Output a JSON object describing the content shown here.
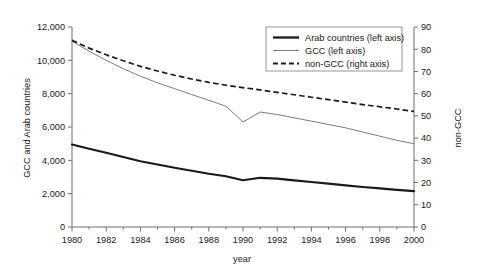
{
  "chart_data": {
    "type": "line",
    "title": "",
    "xlabel": "year",
    "ylabel": "GCC and Arab countries",
    "y2label": "non-GCC",
    "xlim": [
      1980,
      2000
    ],
    "ylim": [
      0,
      12000
    ],
    "y2lim": [
      0,
      90
    ],
    "grid": false,
    "legend_position": "top-right",
    "x": [
      1980,
      1981,
      1982,
      1983,
      1984,
      1985,
      1986,
      1987,
      1988,
      1989,
      1990,
      1991,
      1992,
      1993,
      1994,
      1995,
      1996,
      1997,
      1998,
      1999,
      2000
    ],
    "xticks": [
      1980,
      1982,
      1984,
      1986,
      1988,
      1990,
      1992,
      1994,
      1996,
      1998,
      2000
    ],
    "xtick_labels": [
      "1980",
      "1982",
      "1984",
      "1986",
      "1988",
      "1990",
      "1992",
      "1994",
      "1996",
      "1998",
      "2000"
    ],
    "yticks": [
      0,
      2000,
      4000,
      6000,
      8000,
      10000,
      12000
    ],
    "ytick_labels": [
      "0",
      "2,000",
      "4,000",
      "6,000",
      "8,000",
      "10,000",
      "12,000"
    ],
    "y2ticks": [
      0,
      10,
      20,
      30,
      40,
      50,
      60,
      70,
      80,
      90
    ],
    "y2tick_labels": [
      "0",
      "10",
      "20",
      "30",
      "40",
      "50",
      "60",
      "70",
      "80",
      "90"
    ],
    "series": [
      {
        "name": "Arab countries (left axis)",
        "axis": "left",
        "style": "solid-thick",
        "color": "#1a1a1a",
        "values": [
          4950,
          4700,
          4450,
          4200,
          3950,
          3750,
          3550,
          3380,
          3200,
          3050,
          2800,
          2950,
          2900,
          2800,
          2700,
          2600,
          2500,
          2400,
          2320,
          2230,
          2150
        ]
      },
      {
        "name": "GCC (left axis)",
        "axis": "left",
        "style": "solid-thin",
        "color": "#7d7d7d",
        "values": [
          11150,
          10550,
          10000,
          9500,
          9050,
          8650,
          8300,
          7950,
          7600,
          7250,
          6300,
          6900,
          6750,
          6550,
          6350,
          6150,
          5950,
          5700,
          5450,
          5200,
          5000
        ]
      },
      {
        "name": "non-GCC (right axis)",
        "axis": "right",
        "style": "dashed",
        "color": "#1a1a1a",
        "values": [
          84.0,
          80.5,
          77.5,
          74.8,
          72.3,
          70.2,
          68.3,
          66.6,
          65.1,
          63.8,
          62.7,
          61.7,
          60.6,
          59.5,
          58.4,
          57.3,
          56.2,
          55.1,
          54.1,
          53.1,
          52.0
        ]
      }
    ]
  },
  "legend": {
    "items": [
      {
        "label": "Arab countries (left axis)"
      },
      {
        "label": "GCC (left axis)"
      },
      {
        "label": "non-GCC (right axis)"
      }
    ]
  }
}
